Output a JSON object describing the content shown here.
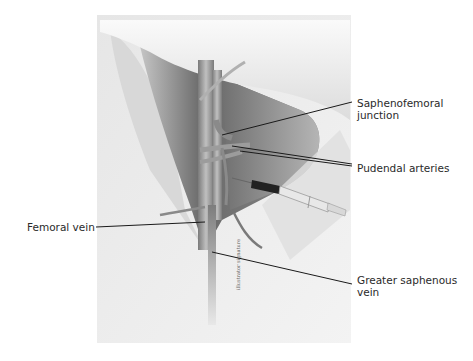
{
  "figure": {
    "type": "anatomical illustration",
    "labels": {
      "saphenofemoral_junction": "Saphenofemoral\njunction",
      "pudendal_arteries": "Pudendal arteries",
      "femoral_vein": "Femoral vein",
      "greater_saphenous_vein": "Greater saphenous\nvein"
    },
    "signature": "illustrator signature",
    "colors": {
      "background": "#ffffff",
      "panel": "#ececec",
      "shadow_dark": "#555555",
      "vessel": "#9a9a9a",
      "leader_line": "#1a1a1a",
      "label_text": "#2a2a2a"
    }
  }
}
